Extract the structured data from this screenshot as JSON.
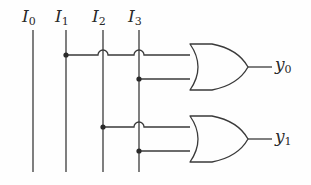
{
  "diagram": {
    "type": "logic-circuit",
    "background_color": "#fefefe",
    "line_color": "#3a3a3a",
    "label_color": "#2a2a2a",
    "inputs": [
      {
        "id": "I0",
        "base": "I",
        "sub": "0",
        "x": 33,
        "label_x": 22,
        "label_y": 8,
        "top_y": 30,
        "bottom_y": 172
      },
      {
        "id": "I1",
        "base": "I",
        "sub": "1",
        "x": 66,
        "label_x": 55,
        "label_y": 8,
        "top_y": 30,
        "bottom_y": 172
      },
      {
        "id": "I2",
        "base": "I",
        "sub": "2",
        "x": 103,
        "label_x": 92,
        "label_y": 8,
        "top_y": 30,
        "bottom_y": 172
      },
      {
        "id": "I3",
        "base": "I",
        "sub": "3",
        "x": 139,
        "label_x": 128,
        "label_y": 8,
        "top_y": 30,
        "bottom_y": 172
      }
    ],
    "outputs": [
      {
        "id": "y0",
        "base": "y",
        "sub": "0",
        "label_x": 275,
        "label_y": 55,
        "wire_y": 67
      },
      {
        "id": "y1",
        "base": "y",
        "sub": "1",
        "label_x": 275,
        "label_y": 127,
        "wire_y": 139
      }
    ],
    "gates": [
      {
        "id": "or-gate-0",
        "type": "OR",
        "output": "y0",
        "back_x": 190,
        "tip_x": 248,
        "top_y": 44,
        "bottom_y": 90,
        "center_y": 67,
        "output_wire_end_x": 272,
        "inputs": [
          {
            "source": "I1",
            "y": 55
          },
          {
            "source": "I3",
            "y": 79
          }
        ]
      },
      {
        "id": "or-gate-1",
        "type": "OR",
        "output": "y1",
        "back_x": 190,
        "tip_x": 248,
        "top_y": 116,
        "bottom_y": 162,
        "center_y": 139,
        "output_wire_end_x": 272,
        "inputs": [
          {
            "source": "I2",
            "y": 127
          },
          {
            "source": "I3",
            "y": 151
          }
        ]
      }
    ],
    "junction_dots": [
      {
        "id": "dot-i1-y0",
        "x": 66,
        "y": 55,
        "r": 2.6
      },
      {
        "id": "dot-i3-y0",
        "x": 139,
        "y": 79,
        "r": 2.6
      },
      {
        "id": "dot-i2-y1",
        "x": 103,
        "y": 127,
        "r": 2.6
      },
      {
        "id": "dot-i3-y1",
        "x": 139,
        "y": 151,
        "r": 2.6
      }
    ],
    "hop_overs": [
      {
        "id": "hop-i2-row-y0",
        "x": 103,
        "y": 55,
        "r": 5
      },
      {
        "id": "hop-i3-row-y0",
        "x": 139,
        "y": 55,
        "r": 5
      },
      {
        "id": "hop-i3-row-y1",
        "x": 139,
        "y": 127,
        "r": 5
      }
    ],
    "wires": [
      {
        "id": "wire-i1-to-or0-in0",
        "from_x": 66,
        "to_x": 190,
        "y": 55
      },
      {
        "id": "wire-i3-to-or0-in1",
        "from_x": 139,
        "to_x": 190,
        "y": 79
      },
      {
        "id": "wire-i2-to-or1-in0",
        "from_x": 103,
        "to_x": 190,
        "y": 127
      },
      {
        "id": "wire-i3-to-or1-in1",
        "from_x": 139,
        "to_x": 190,
        "y": 151
      },
      {
        "id": "wire-or0-out",
        "from_x": 248,
        "to_x": 272,
        "y": 67
      },
      {
        "id": "wire-or1-out",
        "from_x": 248,
        "to_x": 272,
        "y": 139
      }
    ]
  }
}
